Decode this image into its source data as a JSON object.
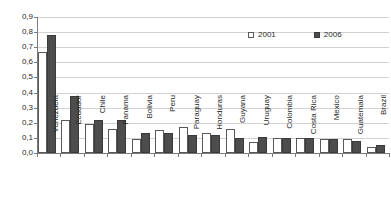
{
  "chart_data": {
    "type": "bar",
    "title": "",
    "subtitle": "",
    "xlabel": "",
    "ylabel": "",
    "ylim": [
      0.0,
      0.9
    ],
    "ytick_labels": [
      "0,9",
      "0,8",
      "0,7",
      "0,6",
      "0,5",
      "0,4",
      "0,3",
      "0,2",
      "0,1",
      "0,0"
    ],
    "ytick_values": [
      0.9,
      0.8,
      0.7,
      0.6,
      0.5,
      0.4,
      0.3,
      0.2,
      0.1,
      0.0
    ],
    "grid": true,
    "legend_position": "top-right",
    "decimal_separator": ",",
    "categories": [
      "Venezuela",
      "Ecuador",
      "Chile",
      "Panama",
      "Bolivia",
      "Peru",
      "Paraguay",
      "Honduras",
      "Guyana",
      "Uruguay",
      "Colombia",
      "Costa Rica",
      "Mexico",
      "Guatemala",
      "Brazil"
    ],
    "series": [
      {
        "name": "2001",
        "color": "#ffffff",
        "edge_color": "#595959",
        "values": [
          0.67,
          0.22,
          0.19,
          0.16,
          0.09,
          0.15,
          0.17,
          0.13,
          0.16,
          0.07,
          0.1,
          0.1,
          0.095,
          0.095,
          0.04
        ]
      },
      {
        "name": "2006",
        "color": "#4d4d4d",
        "edge_color": "#3a3a3a",
        "values": [
          0.78,
          0.38,
          0.22,
          0.22,
          0.135,
          0.13,
          0.12,
          0.12,
          0.1,
          0.105,
          0.1,
          0.1,
          0.095,
          0.08,
          0.05
        ]
      }
    ]
  },
  "legend": {
    "items": [
      {
        "label": "2001",
        "marker": "open-square-marker"
      },
      {
        "label": "2006",
        "marker": "filled-square-marker"
      }
    ]
  },
  "colors": {
    "series_2001": "#ffffff",
    "series_2006": "#4d4d4d",
    "gridline": "#d2d2d2",
    "axis": "#7a7a7a",
    "text": "#2b2b2b",
    "background": "#ffffff"
  }
}
